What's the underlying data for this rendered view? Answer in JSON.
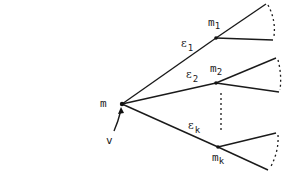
{
  "diagram": {
    "type": "tree",
    "root": {
      "label": "m",
      "pointer_label": "v",
      "x": 122,
      "y": 104
    },
    "children": [
      {
        "node_label": "m",
        "node_sub": "1",
        "edge_label": "ε",
        "edge_sub": "1",
        "x": 216,
        "y": 38
      },
      {
        "node_label": "m",
        "node_sub": "2",
        "edge_label": "ε",
        "edge_sub": "2",
        "x": 216,
        "y": 83
      },
      {
        "node_label": "m",
        "node_sub": "k",
        "edge_label": "ε",
        "edge_sub": "k",
        "x": 218,
        "y": 147
      }
    ],
    "ellipsis": "vertical dotted line between child 2 and child k"
  }
}
